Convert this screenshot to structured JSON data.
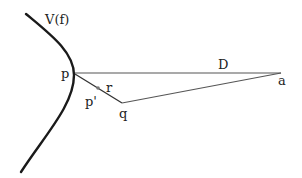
{
  "diagram": {
    "curve_label": "V(f)",
    "points": {
      "p": "p",
      "p_prime": "p'",
      "r": "r",
      "q": "q",
      "a": "a"
    },
    "segment_label": "D",
    "colors": {
      "curve": "#1a1a1a",
      "lines": "#555555",
      "text": "#222222",
      "background": "#ffffff"
    }
  }
}
